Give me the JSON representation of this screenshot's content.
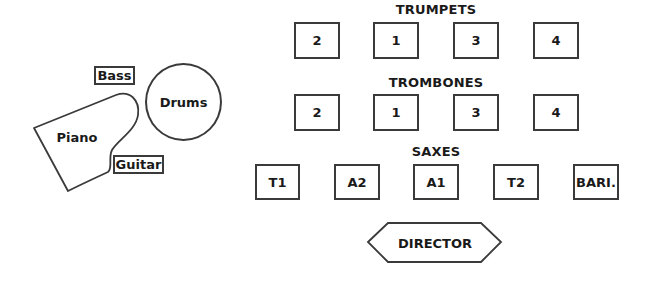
{
  "diagram": {
    "type": "stage-seating-chart",
    "rhythm_section": {
      "bass": "Bass",
      "drums": "Drums",
      "piano": "Piano",
      "guitar": "Guitar"
    },
    "trumpets": {
      "label": "TRUMPETS",
      "seats": [
        "2",
        "1",
        "3",
        "4"
      ]
    },
    "trombones": {
      "label": "TROMBONES",
      "seats": [
        "2",
        "1",
        "3",
        "4"
      ]
    },
    "saxes": {
      "label": "SAXES",
      "seats": [
        "T1",
        "A2",
        "A1",
        "T2",
        "BARI."
      ]
    },
    "director": "DIRECTOR",
    "colors": {
      "stroke": "#3a3a3a",
      "text": "#1a1a1a",
      "background": "#ffffff"
    }
  }
}
